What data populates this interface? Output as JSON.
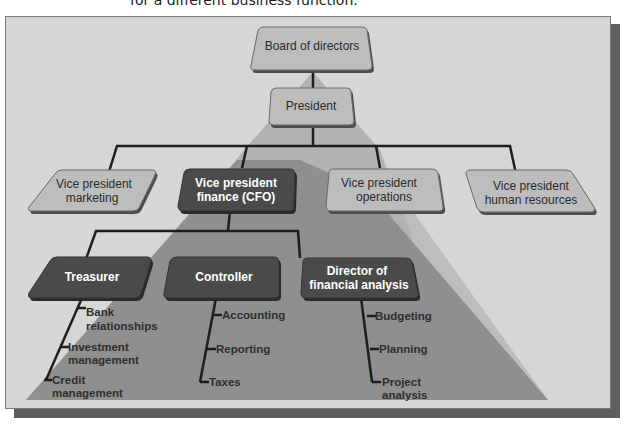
{
  "caption": "for a different business function.",
  "colors": {
    "frame_bg": "#d6d6d6",
    "frame_shadow": "#5e5e5e",
    "pyramid_light": "#b8b8b8",
    "pyramid_dark": "#8f8f8f",
    "box_light": "#bcbcbc",
    "box_dark": "#4a4a4a",
    "line": "#1e1e1e"
  },
  "org": {
    "board": {
      "label": "Board of directors"
    },
    "president": {
      "label": "President"
    },
    "vps": [
      {
        "line1": "Vice president",
        "line2": "marketing",
        "highlighted": false
      },
      {
        "line1": "Vice president",
        "line2": "finance (CFO)",
        "highlighted": true
      },
      {
        "line1": "Vice president",
        "line2": "operations",
        "highlighted": false
      },
      {
        "line1": "Vice president",
        "line2": "human resources",
        "highlighted": false
      }
    ],
    "finance_reports": [
      {
        "line1": "Treasurer",
        "line2": "",
        "duties": [
          {
            "line1": "Bank",
            "line2": "relationships"
          },
          {
            "line1": "Investment",
            "line2": "management"
          },
          {
            "line1": "Credit",
            "line2": "management"
          }
        ]
      },
      {
        "line1": "Controller",
        "line2": "",
        "duties": [
          {
            "line1": "Accounting",
            "line2": ""
          },
          {
            "line1": "Reporting",
            "line2": ""
          },
          {
            "line1": "Taxes",
            "line2": ""
          }
        ]
      },
      {
        "line1": "Director of",
        "line2": "financial analysis",
        "duties": [
          {
            "line1": "Budgeting",
            "line2": ""
          },
          {
            "line1": "Planning",
            "line2": ""
          },
          {
            "line1": "Project",
            "line2": "analysis"
          }
        ]
      }
    ]
  }
}
